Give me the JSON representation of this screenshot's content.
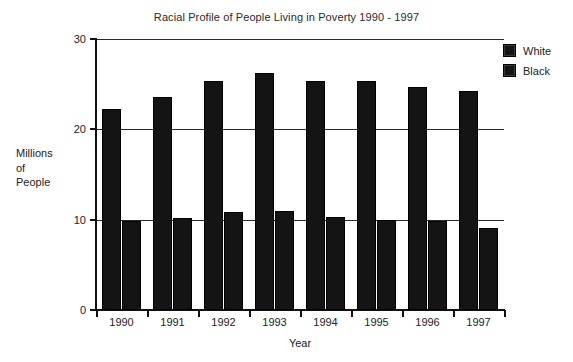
{
  "chart_data": {
    "type": "bar",
    "title": "Racial Profile of People Living in Poverty 1990 - 1997",
    "xlabel": "Year",
    "ylabel": "Millions of People",
    "ylabel_lines": [
      "Millions",
      "of",
      "People"
    ],
    "categories": [
      "1990",
      "1991",
      "1992",
      "1993",
      "1994",
      "1995",
      "1996",
      "1997"
    ],
    "series": [
      {
        "name": "White",
        "color": "#141414",
        "values": [
          22.2,
          23.6,
          25.3,
          26.2,
          25.4,
          25.4,
          24.7,
          24.3
        ]
      },
      {
        "name": "Black",
        "color": "#141414",
        "values": [
          9.8,
          10.2,
          10.8,
          11.0,
          10.3,
          10.0,
          9.8,
          9.1
        ]
      }
    ],
    "ylim": [
      0,
      30
    ],
    "yticks": [
      0,
      10,
      20,
      30
    ],
    "ytick_labels": [
      "0",
      "10",
      "20",
      "30"
    ],
    "grid": true,
    "gridlines_at": [
      10,
      20,
      30
    ],
    "legend_position": "right-top"
  },
  "legend": {
    "items": [
      {
        "label": "White"
      },
      {
        "label": "Black"
      }
    ]
  }
}
